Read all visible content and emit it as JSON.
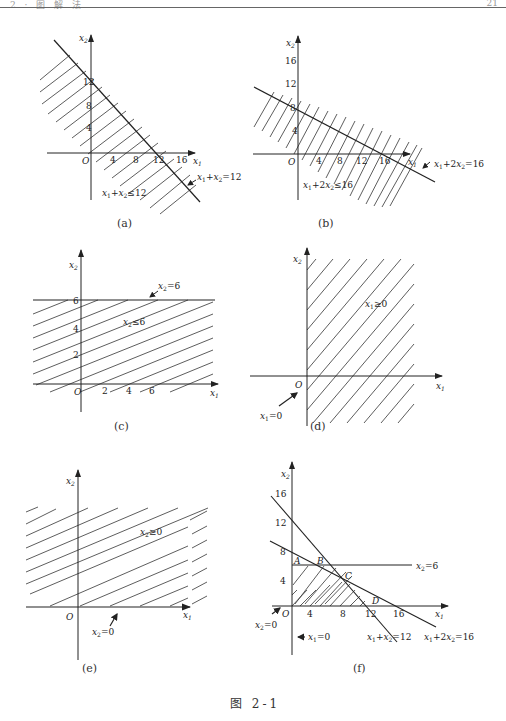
{
  "header": {
    "left_text": "2 · 图 解 法",
    "page_number": "21"
  },
  "figure_title": "图 2-1",
  "panels": {
    "a": {
      "caption": "(a)",
      "x_axis_label": "x1",
      "y_axis_label": "x2",
      "origin_label": "O",
      "x_ticks": [
        "4",
        "8",
        "12",
        "16"
      ],
      "y_ticks": [
        "4",
        "8",
        "12"
      ],
      "line_label": "x1+x2=12",
      "region_label": "x1+x2≤12"
    },
    "b": {
      "caption": "(b)",
      "x_axis_label": "x1",
      "y_axis_label": "x2",
      "origin_label": "O",
      "x_ticks": [
        "4",
        "8",
        "12",
        "16"
      ],
      "y_ticks": [
        "4",
        "8",
        "12",
        "16"
      ],
      "line_label": "x1+2x2=16",
      "region_label": "x1+2x2≤16"
    },
    "c": {
      "caption": "(c)",
      "x_axis_label": "x1",
      "y_axis_label": "x2",
      "origin_label": "O",
      "x_ticks": [
        "2",
        "4",
        "6"
      ],
      "y_ticks": [
        "2",
        "4",
        "6"
      ],
      "line_label": "x2=6",
      "region_label": "x2≤6"
    },
    "d": {
      "caption": "(d)",
      "x_axis_label": "x1",
      "y_axis_label": "x2",
      "origin_label": "O",
      "line_label": "x1=0",
      "region_label": "x1≥0"
    },
    "e": {
      "caption": "(e)",
      "x_axis_label": "x1",
      "y_axis_label": "x2",
      "origin_label": "O",
      "line_label": "x2=0",
      "region_label": "x2≥0"
    },
    "f": {
      "caption": "(f)",
      "x_axis_label": "x1",
      "y_axis_label": "x2",
      "origin_label": "O",
      "x_ticks": [
        "4",
        "8",
        "12",
        "16"
      ],
      "y_ticks": [
        "4",
        "8",
        "12",
        "16"
      ],
      "points": [
        "A",
        "B",
        "C",
        "D"
      ],
      "line_labels": {
        "x2_eq_6": "x2=6",
        "x1_eq_0": "x1=0",
        "x2_eq_0": "x2=0",
        "sum": "x1+x2=12",
        "weighted": "x1+2x2=16"
      }
    }
  }
}
